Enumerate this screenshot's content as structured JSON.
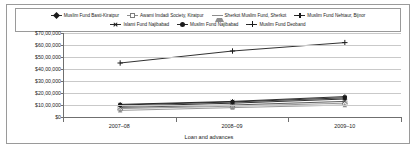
{
  "chart_data": {
    "type": "line",
    "title": "",
    "xlabel": "Loan and advances",
    "ylabel": "",
    "categories": [
      "2007–08",
      "2008–09",
      "2009–10"
    ],
    "ylim": [
      0,
      7000000
    ],
    "ytick_values": [
      0,
      1000000,
      2000000,
      3000000,
      4000000,
      5000000,
      6000000,
      7000000
    ],
    "ytick_labels": [
      "$0",
      "$10,00,000",
      "$20,00,000",
      "$30,00,000",
      "$40,00,000",
      "$50,00,000",
      "$60,00,000",
      "$70,00,000"
    ],
    "grid": true,
    "legend_position": "top",
    "series": [
      {
        "name": "Muslim Fund Basti-Kiratpur",
        "marker": "diamond",
        "color": "#1a1a1a",
        "values": [
          900000,
          1150000,
          1500000
        ]
      },
      {
        "name": "Awami Imdadi Society, Kiratpur",
        "marker": "square-open",
        "color": "#8d8d8d",
        "values": [
          700000,
          900000,
          1150000
        ]
      },
      {
        "name": "Sherkot Muslim Fund, Sherkot",
        "marker": "triangle",
        "color": "#8d8d8d",
        "values": [
          550000,
          780000,
          1000000
        ]
      },
      {
        "name": "Muslim Fund Nehtaur, Bijnor",
        "marker": "star",
        "color": "#1a1a1a",
        "values": [
          1050000,
          1300000,
          1700000
        ]
      },
      {
        "name": "Islami Fund Najibabad",
        "marker": "cross",
        "color": "#4a4a4a",
        "values": [
          800000,
          1000000,
          1300000
        ]
      },
      {
        "name": "Muslim Fund Najibabad",
        "marker": "circle",
        "color": "#1a1a1a",
        "values": [
          1000000,
          1250000,
          1600000
        ]
      },
      {
        "name": "Muslim Fund Deoband",
        "marker": "plus",
        "color": "#1a1a1a",
        "values": [
          4500000,
          5500000,
          6200000
        ]
      }
    ]
  },
  "legend": {
    "row1": [
      {
        "label": "Muslim Fund Basti-Kiratpur",
        "marker": "diamond"
      },
      {
        "label": "Awami Imdadi Society, Kiratpur",
        "marker": "square-open"
      },
      {
        "label": "Sherkot Muslim Fund, Sherkot",
        "marker": "triangle"
      },
      {
        "label": "Muslim Fund Nehtaur, Bijnor",
        "marker": "star"
      }
    ],
    "row2": [
      {
        "label": "Islami Fund Najibabad",
        "marker": "cross"
      },
      {
        "label": "Muslim Fund Najibabad",
        "marker": "circle"
      },
      {
        "label": "Muslim Fund Deoband",
        "marker": "plus"
      }
    ]
  }
}
